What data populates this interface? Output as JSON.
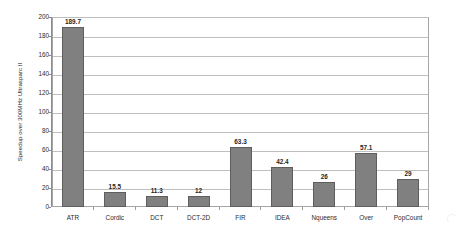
{
  "chart_data": {
    "type": "bar",
    "title": "",
    "subtitle": "",
    "xlabel": "",
    "ylabel": "Speedup over 300MHz Ultrasparc II",
    "categories": [
      "ATR",
      "Cordic",
      "DCT",
      "DCT-2D",
      "FIR",
      "IDEA",
      "Nqueens",
      "Over",
      "PopCount"
    ],
    "values": [
      189.7,
      15.5,
      11.3,
      12,
      63.3,
      42.4,
      26,
      57.1,
      29
    ],
    "value_labels": [
      "189.7",
      "15.5",
      "11.3",
      "12",
      "63.3",
      "42.4",
      "26",
      "57.1",
      "29"
    ],
    "ylim": [
      0,
      200
    ],
    "ytick_step": 20,
    "ytick_labels": [
      "200",
      "180",
      "160",
      "140",
      "120",
      "100",
      "80",
      "60",
      "40",
      "20",
      "0"
    ],
    "grid": true,
    "grid_axis": "y",
    "legend": false,
    "legend_position": "none",
    "bar_color": "#808080",
    "bar_edge_color": "#5e5e5e",
    "grid_color": "#bfbfbf",
    "axis_color": "#8c8c8c",
    "text_color": "#2b2b2b",
    "background_color": "#ffffff"
  }
}
